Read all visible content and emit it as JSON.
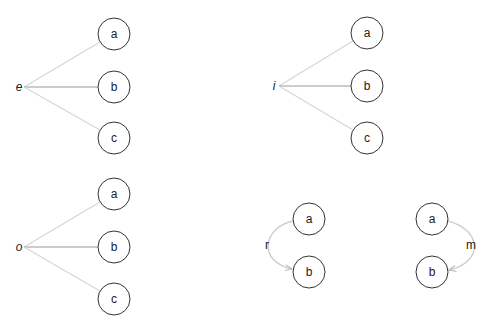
{
  "diagram": {
    "fan_groups": [
      {
        "source": "e",
        "source_pos": [
          19,
          87
        ],
        "targets": [
          {
            "label": "a",
            "pos": [
              114,
              34
            ]
          },
          {
            "label": "b",
            "pos": [
              114,
              87
            ]
          },
          {
            "label": "c",
            "pos": [
              114,
              138
            ]
          }
        ]
      },
      {
        "source": "i",
        "source_pos": [
          274,
          86
        ],
        "targets": [
          {
            "label": "a",
            "pos": [
              367,
              33
            ]
          },
          {
            "label": "b",
            "pos": [
              367,
              86
            ]
          },
          {
            "label": "c",
            "pos": [
              367,
              138
            ]
          }
        ]
      },
      {
        "source": "o",
        "source_pos": [
          19,
          247
        ],
        "targets": [
          {
            "label": "a",
            "pos": [
              114,
              194
            ]
          },
          {
            "label": "b",
            "pos": [
              114,
              247
            ]
          },
          {
            "label": "c",
            "pos": [
              114,
              299
            ]
          }
        ]
      }
    ],
    "arc_groups": [
      {
        "edge_label": "r",
        "side": "left",
        "from": {
          "label": "a",
          "pos": [
            309,
            219
          ]
        },
        "to": {
          "label": "b",
          "pos": [
            309,
            272
          ]
        },
        "label_pos": [
          267,
          245
        ]
      },
      {
        "edge_label": "m",
        "side": "right",
        "from": {
          "label": "a",
          "pos": [
            432,
            219
          ]
        },
        "to": {
          "label": "b",
          "pos": [
            432,
            272
          ]
        },
        "label_pos": [
          471,
          245
        ]
      }
    ],
    "node_radius": 16,
    "colors": {
      "node_stroke": "#333333",
      "edge_light": "#d6d6d6",
      "edge_dark": "#9a9a9a",
      "arc": "#cfcfcf"
    }
  }
}
